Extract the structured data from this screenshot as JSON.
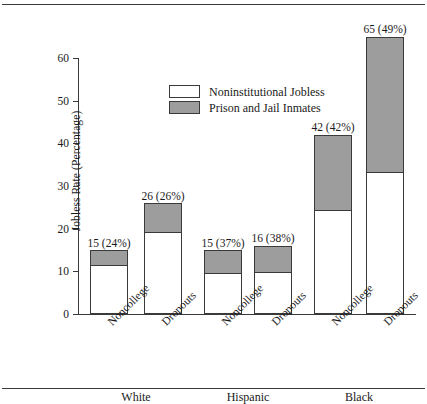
{
  "chart_data": {
    "type": "bar",
    "subtype": "stacked-bar",
    "title": "",
    "xlabel": "",
    "ylabel": "Jobless Rate (Percentage)",
    "ylim": [
      0,
      60
    ],
    "yticks": [
      0,
      10,
      20,
      30,
      40,
      50,
      60
    ],
    "ytick_labels": [
      "0",
      "10",
      "20",
      "30",
      "40",
      "50",
      "60"
    ],
    "grid": false,
    "legend_position": "upper-left-inside",
    "categories": [
      "Noncollege",
      "Dropouts",
      "Noncollege",
      "Dropouts",
      "Noncollege",
      "Dropouts"
    ],
    "groups": [
      "White",
      "Hispanic",
      "Black"
    ],
    "series": [
      {
        "name": "Noninstitutional Jobless",
        "color": "#ffffff",
        "values": [
          11.4,
          19.2,
          9.5,
          9.9,
          24.4,
          33.2
        ]
      },
      {
        "name": "Prison and Jail Inmates",
        "color": "#9d9d9d",
        "values": [
          3.6,
          6.8,
          5.5,
          6.1,
          17.6,
          31.8
        ]
      }
    ],
    "totals": [
      15,
      26,
      15,
      16,
      42,
      65
    ],
    "incarcerated_share_pct": [
      24,
      26,
      37,
      38,
      42,
      49
    ],
    "annotations": [
      "15 (24%)",
      "26 (26%)",
      "15 (37%)",
      "16 (38%)",
      "42 (42%)",
      "65 (49%)"
    ]
  },
  "axis": {
    "y_title": "Jobless Rate (Percentage)",
    "ticks": [
      {
        "value": 60,
        "label": "60"
      },
      {
        "value": 50,
        "label": "50"
      },
      {
        "value": 40,
        "label": "40"
      },
      {
        "value": 30,
        "label": "30"
      },
      {
        "value": 20,
        "label": "20"
      },
      {
        "value": 10,
        "label": "10"
      },
      {
        "value": 0,
        "label": "0"
      }
    ]
  },
  "legend": {
    "items": [
      {
        "label": "Noninstitutional Jobless",
        "color": "#ffffff"
      },
      {
        "label": "Prison and Jail Inmates",
        "color": "#9d9d9d"
      }
    ]
  },
  "bars": [
    {
      "group": "White",
      "category": "Noncollege",
      "label": "15 (24%)",
      "total": 15,
      "jobless": 11.4,
      "inmates": 3.6
    },
    {
      "group": "White",
      "category": "Dropouts",
      "label": "26 (26%)",
      "total": 26,
      "jobless": 19.2,
      "inmates": 6.8
    },
    {
      "group": "Hispanic",
      "category": "Noncollege",
      "label": "15 (37%)",
      "total": 15,
      "jobless": 9.5,
      "inmates": 5.5
    },
    {
      "group": "Hispanic",
      "category": "Dropouts",
      "label": "16 (38%)",
      "total": 16,
      "jobless": 9.9,
      "inmates": 6.1
    },
    {
      "group": "Black",
      "category": "Noncollege",
      "label": "42 (42%)",
      "total": 42,
      "jobless": 24.4,
      "inmates": 17.6
    },
    {
      "group": "Black",
      "category": "Dropouts",
      "label": "65 (49%)",
      "total": 65,
      "jobless": 33.2,
      "inmates": 31.8
    }
  ],
  "group_labels": [
    {
      "text": "White"
    },
    {
      "text": "Hispanic"
    },
    {
      "text": "Black"
    }
  ]
}
